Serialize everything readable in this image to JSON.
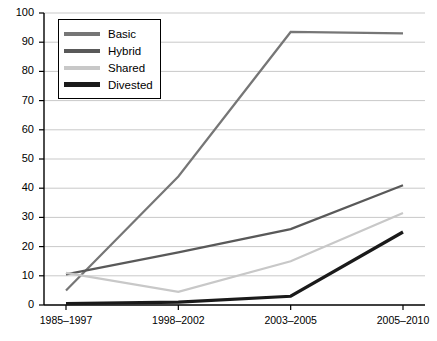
{
  "chart_data": {
    "type": "line",
    "title": "",
    "xlabel": "",
    "ylabel": "",
    "categories": [
      "1985–1997",
      "1998–2002",
      "2003–2005",
      "2005–2010"
    ],
    "ylim": [
      0,
      100
    ],
    "ytick_step": 10,
    "yticks": [
      "0",
      "10",
      "20",
      "30",
      "40",
      "50",
      "60",
      "70",
      "80",
      "90",
      "100"
    ],
    "grid": "horizontal",
    "legend_position": "top-left-inside",
    "series": [
      {
        "name": "Basic",
        "values": [
          5,
          44,
          93.5,
          93
        ],
        "color": "#767676",
        "width": 2.2
      },
      {
        "name": "Hybrid",
        "values": [
          10.5,
          18,
          26,
          41
        ],
        "color": "#595959",
        "width": 2.2
      },
      {
        "name": "Shared",
        "values": [
          11,
          4.5,
          15,
          31.5
        ],
        "color": "#c8c8c8",
        "width": 2.2
      },
      {
        "name": "Divested",
        "values": [
          0.5,
          1,
          3,
          25
        ],
        "color": "#1a1a1a",
        "width": 3.2
      }
    ]
  },
  "axes": {
    "axis_color": "#000000",
    "grid_color": "#c9c9c9",
    "background": "#ffffff"
  }
}
